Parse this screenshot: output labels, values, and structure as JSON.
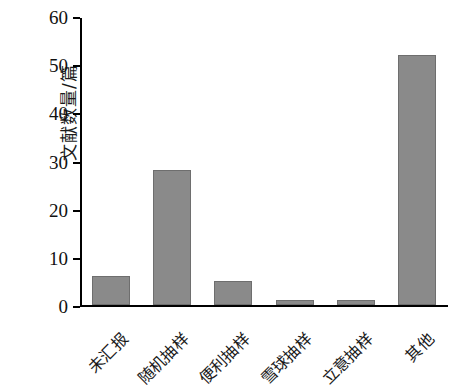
{
  "chart_data": {
    "type": "bar",
    "title": "",
    "xlabel": "",
    "ylabel": "文献数量/篇",
    "categories": [
      "未汇报",
      "随机抽样",
      "便利抽样",
      "雪球抽样",
      "立意抽样",
      "其他"
    ],
    "values": [
      6,
      28,
      5,
      1,
      1,
      52
    ],
    "series": [
      {
        "name": "文献数量",
        "values": [
          6,
          28,
          5,
          1,
          1,
          52
        ]
      }
    ],
    "ylim": [
      0,
      60
    ],
    "ytick_values": [
      0,
      10,
      20,
      30,
      40,
      50,
      60
    ],
    "ytick_labels": [
      "0",
      "10",
      "20",
      "30",
      "40",
      "50",
      "60"
    ],
    "grid": false,
    "legend": false,
    "legend_position": "none",
    "bar_color": "#8a8a8a",
    "bar_edge_color": "#6e6e6e",
    "axis_color": "#000000",
    "background_color": "#ffffff",
    "xtick_label_rotation": "45"
  }
}
